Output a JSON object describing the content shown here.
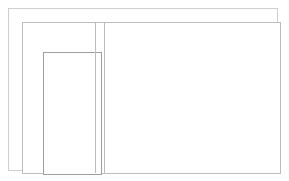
{
  "page": {
    "background_color": "#ffffff"
  },
  "borders": {
    "page_border_color": "#cfcfcf",
    "content_frame_color": "#bdbdbd",
    "sidebar_box_color": "#9e9e9e",
    "divider_color": "#bdbdbd"
  },
  "sidebar": {
    "label": "",
    "box": {
      "label": "",
      "content": ""
    }
  },
  "divider": {
    "primary_label": "",
    "secondary_label": ""
  },
  "main": {
    "label": "",
    "content": ""
  }
}
